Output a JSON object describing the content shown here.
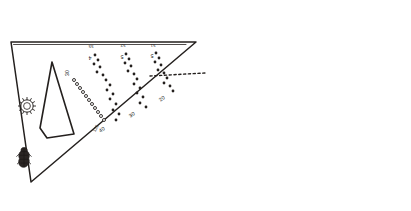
{
  "figure": {
    "title": "Two mirrored right-triangle field plan sketches",
    "background_color": "#ffffff",
    "ink_color": "#24201e",
    "width": 411,
    "height": 211
  },
  "panels": [
    {
      "id": "left-panel",
      "name": "left-triangle-plan",
      "orientation": "apex-bottom-left",
      "rosette_label": "N",
      "plot_label": "",
      "edge_labels": [
        {
          "text": "40",
          "x": 103,
          "y": 131
        },
        {
          "text": "30",
          "x": 133,
          "y": 116
        },
        {
          "text": "20",
          "x": 163,
          "y": 100
        }
      ],
      "row_labels": [
        {
          "text": "30",
          "x": 69,
          "y": 73
        },
        {
          "text": "125",
          "x": 95,
          "y": 128
        },
        {
          "text": "55",
          "x": 91,
          "y": 45
        },
        {
          "text": "52",
          "x": 123,
          "y": 44
        },
        {
          "text": "51",
          "x": 153,
          "y": 44
        },
        {
          "text": "4",
          "x": 90,
          "y": 55
        },
        {
          "text": "5",
          "x": 122,
          "y": 54
        },
        {
          "text": "5",
          "x": 152,
          "y": 53
        }
      ]
    },
    {
      "id": "right-panel",
      "name": "right-triangle-plan",
      "orientation": "apex-top-right",
      "rosette_label": "N",
      "plot_label": "",
      "edge_labels": [
        {
          "text": "40",
          "x": 308,
          "y": 80
        },
        {
          "text": "30",
          "x": 278,
          "y": 95
        },
        {
          "text": "20",
          "x": 248,
          "y": 111
        }
      ],
      "row_labels": [
        {
          "text": "30",
          "x": 342,
          "y": 138
        },
        {
          "text": "125",
          "x": 316,
          "y": 83
        },
        {
          "text": "55",
          "x": 320,
          "y": 166
        },
        {
          "text": "52",
          "x": 288,
          "y": 167
        },
        {
          "text": "51",
          "x": 258,
          "y": 167
        },
        {
          "text": "4",
          "x": 321,
          "y": 156
        },
        {
          "text": "5",
          "x": 289,
          "y": 157
        },
        {
          "text": "5",
          "x": 259,
          "y": 158
        }
      ]
    }
  ],
  "legend": {
    "rosette_name": "compass-rosette",
    "figure_sketch_name": "human-figure-sketch",
    "plot_name": "irregular-plot-outline",
    "point_rows_name": "dotted-point-rows"
  }
}
